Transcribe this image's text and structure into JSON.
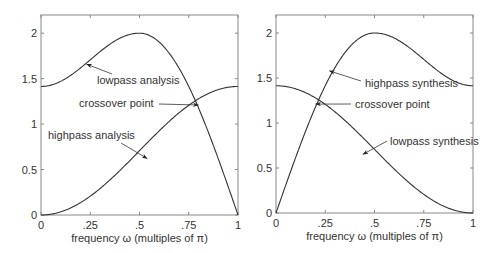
{
  "chart_data": [
    {
      "type": "line",
      "title": "",
      "xlabel": "frequency ω (multiples of π)",
      "ylabel": "",
      "xlim": [
        0,
        1
      ],
      "ylim": [
        0,
        2.2
      ],
      "xticks": [
        "0",
        ".25",
        ".5",
        ".75",
        "1"
      ],
      "yticks": [
        "0",
        "0.5",
        "1",
        "1.5",
        "2"
      ],
      "grid": false,
      "series": [
        {
          "name": "lowpass analysis",
          "x": [
            0,
            0.125,
            0.25,
            0.375,
            0.5,
            0.625,
            0.75,
            0.8,
            0.875,
            1
          ],
          "values": [
            1.414,
            1.5,
            1.66,
            1.86,
            2.0,
            1.86,
            1.41,
            1.2,
            0.77,
            0
          ]
        },
        {
          "name": "highpass analysis",
          "x": [
            0,
            0.125,
            0.25,
            0.375,
            0.5,
            0.625,
            0.75,
            0.8,
            0.875,
            1
          ],
          "values": [
            0,
            0.03,
            0.1,
            0.25,
            0.5,
            0.8,
            1.1,
            1.2,
            1.33,
            1.414
          ]
        }
      ],
      "annotations": [
        {
          "text": "lowpass analysis",
          "x": 0.23,
          "y": 1.66
        },
        {
          "text": "crossover point",
          "x": 0.8,
          "y": 1.21
        },
        {
          "text": "highpass analysis",
          "x": 0.54,
          "y": 0.62
        }
      ]
    },
    {
      "type": "line",
      "title": "",
      "xlabel": "frequency ω (multiples of π)",
      "ylabel": "",
      "xlim": [
        0,
        1
      ],
      "ylim": [
        0,
        2.2
      ],
      "xticks": [
        "0",
        ".25",
        ".5",
        ".75",
        "1"
      ],
      "yticks": [
        "0",
        "0.5",
        "1",
        "1.5",
        "2"
      ],
      "grid": false,
      "series": [
        {
          "name": "highpass synthesis",
          "x": [
            0,
            0.125,
            0.2,
            0.25,
            0.375,
            0.5,
            0.625,
            0.75,
            0.875,
            1
          ],
          "values": [
            0,
            0.77,
            1.2,
            1.41,
            1.86,
            2.0,
            1.86,
            1.66,
            1.5,
            1.414
          ]
        },
        {
          "name": "lowpass synthesis",
          "x": [
            0,
            0.125,
            0.2,
            0.25,
            0.375,
            0.5,
            0.625,
            0.75,
            0.875,
            1
          ],
          "values": [
            1.414,
            1.33,
            1.2,
            1.1,
            0.8,
            0.5,
            0.25,
            0.1,
            0.03,
            0
          ]
        }
      ],
      "annotations": [
        {
          "text": "highpass synthesis",
          "x": 0.27,
          "y": 1.58
        },
        {
          "text": "crossover point",
          "x": 0.2,
          "y": 1.21
        },
        {
          "text": "lowpass synthesis",
          "x": 0.44,
          "y": 0.65
        }
      ]
    }
  ],
  "plots": [
    {
      "xlabel": "frequency ω (multiples of π)",
      "xticks": [
        "0",
        ".25",
        ".5",
        ".75",
        "1"
      ],
      "yticks": [
        "0",
        "0.5",
        "1",
        "1.5",
        "2"
      ],
      "labels": {
        "a": "lowpass analysis",
        "b": "crossover point",
        "c": "highpass analysis"
      }
    },
    {
      "xlabel": "frequency ω (multiples of π)",
      "xticks": [
        "0",
        ".25",
        ".5",
        ".75",
        "1"
      ],
      "yticks": [
        "0",
        "0.5",
        "1",
        "1.5",
        "2"
      ],
      "labels": {
        "a": "highpass synthesis",
        "b": "crossover point",
        "c": "lowpass synthesis"
      }
    }
  ]
}
